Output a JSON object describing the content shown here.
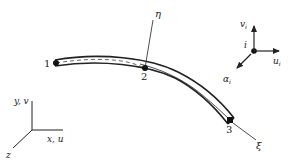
{
  "diagram": {
    "type": "curved beam element with local and global coordinate systems",
    "nodes": [
      {
        "id": "1",
        "label": "1"
      },
      {
        "id": "2",
        "label": "2"
      },
      {
        "id": "3",
        "label": "3"
      }
    ],
    "local_axes": {
      "eta": "η",
      "xi": "ξ"
    },
    "node_dof": {
      "node_label": "i",
      "v": "v",
      "v_sub": "i",
      "u": "u",
      "u_sub": "i",
      "alpha": "α",
      "alpha_sub": "i"
    },
    "global_axes": {
      "y": "y, v",
      "x": "x, u",
      "z": "z"
    },
    "colors": {
      "stroke": "#222222",
      "background": "#ffffff"
    }
  }
}
